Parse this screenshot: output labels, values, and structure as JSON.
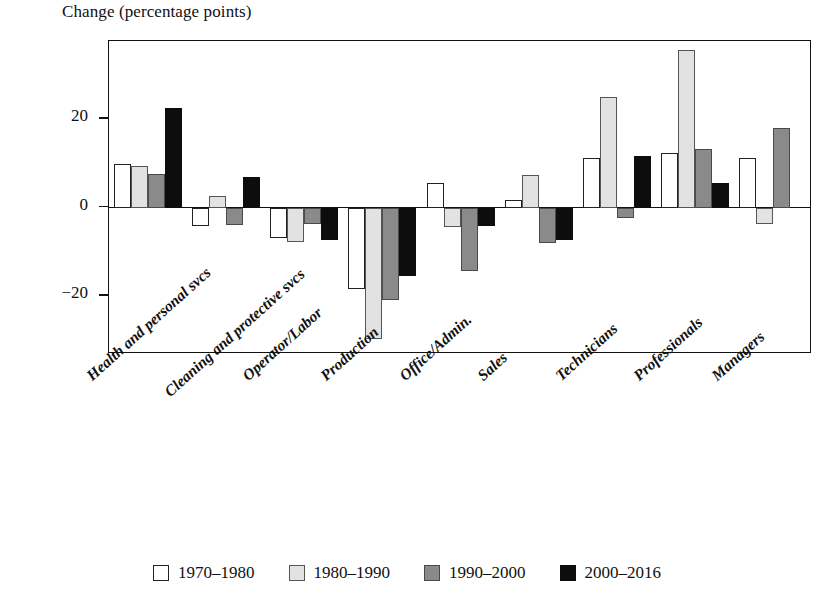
{
  "chart_data": {
    "type": "bar",
    "title": "",
    "ylabel": "Change (percentage points)",
    "xlabel": "",
    "ylim": [
      -33,
      38
    ],
    "yticks": [
      20,
      0,
      -20
    ],
    "ytick_labels": [
      "20",
      "0",
      "−20"
    ],
    "grid": false,
    "legend_position": "bottom",
    "categories": [
      "Health and personal svcs",
      "Cleaning and protective svcs",
      "Operator/Labor",
      "Production",
      "Office/Admin.",
      "Sales",
      "Technicians",
      "Professionals",
      "Managers"
    ],
    "series": [
      {
        "name": "1970–1980",
        "color": "#ffffff",
        "values": [
          9.8,
          -4.2,
          -6.9,
          -18.4,
          5.6,
          1.8,
          11.3,
          12.4,
          11.1
        ]
      },
      {
        "name": "1980–1990",
        "color": "#e2e2e2",
        "values": [
          9.4,
          2.7,
          -7.8,
          -29.6,
          -4.4,
          7.3,
          24.9,
          35.6,
          -3.6
        ]
      },
      {
        "name": "1990–2000",
        "color": "#8a8a8a",
        "values": [
          7.6,
          -4.0,
          -3.6,
          -20.9,
          -14.2,
          -8.0,
          -2.4,
          13.3,
          18.0
        ]
      },
      {
        "name": "2000–2016",
        "color": "#0d0d0d",
        "values": [
          22.4,
          6.9,
          -7.3,
          -15.3,
          -4.2,
          -7.3,
          11.6,
          5.6,
          null
        ]
      }
    ]
  },
  "legend": {
    "items": [
      {
        "label": "1970–1980",
        "swatch": "white-square-icon"
      },
      {
        "label": "1980–1990",
        "swatch": "light-gray-square-icon"
      },
      {
        "label": "1990–2000",
        "swatch": "medium-gray-square-icon"
      },
      {
        "label": "2000–2016",
        "swatch": "black-square-icon"
      }
    ]
  }
}
